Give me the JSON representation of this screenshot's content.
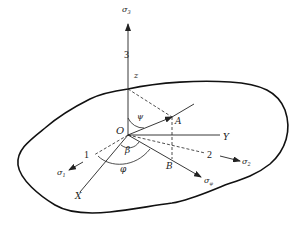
{
  "diagram": {
    "type": "stress-coordinate-diagram",
    "origin_label": "O",
    "axes": {
      "vertical": {
        "label": "z",
        "principal_index": "3",
        "stress_label": "σ",
        "stress_sub": "3"
      },
      "y_axis": {
        "label": "Y"
      },
      "x_axis": {
        "label": "X"
      }
    },
    "principal_directions": [
      {
        "index": "1",
        "stress_label": "σ",
        "stress_sub": "1"
      },
      {
        "index": "2",
        "stress_label": "σ",
        "stress_sub": "2"
      }
    ],
    "points": {
      "a": "A",
      "b": "B"
    },
    "angles": {
      "psi": "ψ",
      "beta": "β",
      "phi": "φ"
    },
    "normal_stress": {
      "label": "σ",
      "sub": "φ"
    },
    "colors": {
      "stroke": "#222222",
      "background": "#ffffff"
    }
  }
}
